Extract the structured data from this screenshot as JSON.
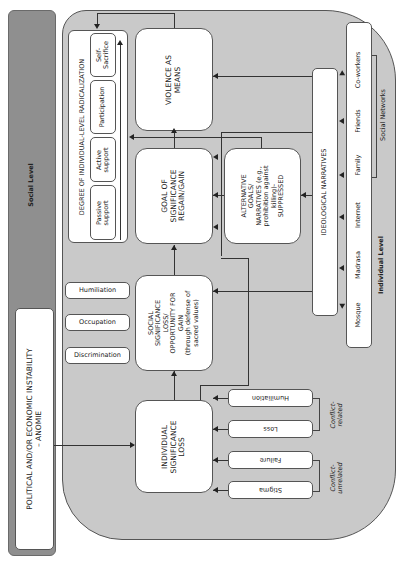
{
  "levels": {
    "social": "Social Level",
    "individual": "Individual Level"
  },
  "anomie": {
    "line1": "POLITICAL AND/OR ECONOMIC INSTABILITY",
    "line2": "– ANOMIE"
  },
  "radicalization": {
    "title": "DEGREE OF INDIVIDUAL-LEVEL RADICALIZATION",
    "stages": [
      {
        "line1": "Passive",
        "line2": "support"
      },
      {
        "line1": "Active",
        "line2": "support"
      },
      {
        "line1": "Participation",
        "line2": ""
      },
      {
        "line1": "Self-",
        "line2": "Sacrifice"
      }
    ]
  },
  "violence": {
    "line1": "VIOLENCE AS",
    "line2": "MEANS"
  },
  "goal": {
    "line1": "GOAL OF",
    "line2": "SIGNIFICANCE",
    "line3": "REGAIN/GAIN"
  },
  "alternative": {
    "line1": "ALTERNATIVE",
    "line2": "GOALS/",
    "line3": "NARRATIVES (e.g.,",
    "line4": "prohibition against",
    "line5": "killing)-",
    "line6": "SUPPRESSED"
  },
  "social_significance": {
    "line1": "SOCIAL",
    "line2": "SIGNIFICANCE",
    "line3": "LOSS/",
    "line4": "OPPORTUNITY FOR",
    "line5": "GAIN",
    "line6": "(through defense of",
    "line7": "sacred values)"
  },
  "individual_loss": {
    "line1": "INDIVIDUAL",
    "line2": "SIGNIFICANCE",
    "line3": "LOSS"
  },
  "social_factors": [
    "Humiliation",
    "Occupation",
    "Discrimination"
  ],
  "individual_factors": {
    "conflict_related": {
      "label_line1": "Conflict-",
      "label_line2": "related",
      "items": [
        "Humiliation",
        "Loss"
      ]
    },
    "conflict_unrelated": {
      "label_line1": "Conflict-",
      "label_line2": "unrelated",
      "items": [
        "Failure",
        "Stigma"
      ]
    }
  },
  "ideological": "IDEOLOGICAL NARRATIVES",
  "networks": {
    "items": [
      "Mosque",
      "Madrasa",
      "Internet",
      "Family",
      "Friends",
      "Co-workers"
    ],
    "label": "Social Networks"
  }
}
